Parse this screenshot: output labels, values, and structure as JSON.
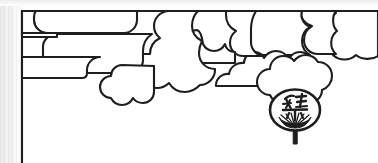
{
  "page": {
    "kind": "scanned-illustration-page",
    "background_color": "#ffffff",
    "ink_color": "#1a1a1a",
    "gutter_shadow_color": "#ededed",
    "width": 378,
    "height": 163
  },
  "artwork": {
    "title": "Stylized cloud border with festival uchiwa fan",
    "style": "japanese-line-art",
    "motifs": [
      {
        "name": "kasumi-cloud-band",
        "label": "Stylized cloud band",
        "position": "top",
        "description": "Horizontal band of overlapping rounded cloud forms drawn in black outline, hanging from the top frame rule"
      },
      {
        "name": "frame-rule",
        "label": "Frame rule",
        "description": "Black ruled border line along the top and down the left side of the page"
      },
      {
        "name": "uchiwa-fan",
        "label": "Uchiwa fan",
        "description": "Round flat paper fan with ribbed base and straight handle",
        "position": "lower right"
      }
    ]
  },
  "fan": {
    "name": "uchiwa-fan",
    "glyph": "祭",
    "glyph_romaji": "matsuri",
    "glyph_meaning": "festival",
    "outline_color": "#1a1a1a",
    "fill_color": "#ffffff",
    "center_x": 295,
    "center_y": 111
  },
  "frame": {
    "top_rule_y": 11,
    "left_rule_x": 22,
    "stroke_width": 2,
    "color": "#1a1a1a"
  }
}
